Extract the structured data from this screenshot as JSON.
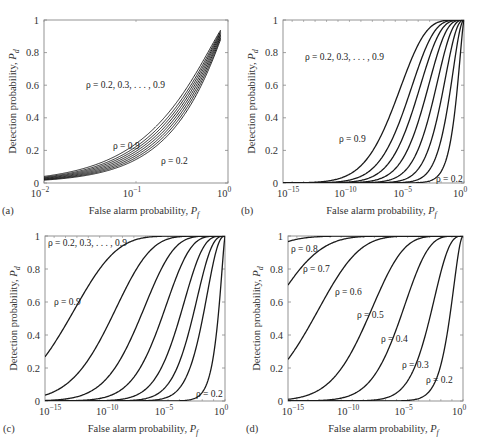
{
  "chart_data": [
    {
      "panel": "(a)",
      "type": "line",
      "xscale": "log",
      "xlim_exp": [
        -2,
        0
      ],
      "ylim": [
        0,
        1
      ],
      "xlabel": "False alarm probability, P_f",
      "ylabel": "Detection probability, P_d",
      "yticks": [
        "0",
        "0.2",
        "0.4",
        "0.6",
        "0.8",
        "1"
      ],
      "xticks": [
        {
          "base": "10",
          "exp": "−2",
          "v": -2
        },
        {
          "base": "10",
          "exp": "−1",
          "v": -1
        },
        {
          "base": "10",
          "exp": "0",
          "v": 0
        }
      ],
      "pf_max_exp": -0.08,
      "annotations": [
        {
          "text": "ρ = 0.2, 0.3, . . . , 0.9",
          "x": 86,
          "y": 88
        },
        {
          "text": "ρ = 0.9",
          "x": 113,
          "y": 149
        },
        {
          "text": "ρ = 0.2",
          "x": 161,
          "y": 164
        }
      ],
      "series": [
        {
          "name": "ρ = 0.2",
          "d": 0.22
        },
        {
          "name": "ρ = 0.3",
          "d": 0.27
        },
        {
          "name": "ρ = 0.4",
          "d": 0.32
        },
        {
          "name": "ρ = 0.5",
          "d": 0.37
        },
        {
          "name": "ρ = 0.6",
          "d": 0.42
        },
        {
          "name": "ρ = 0.7",
          "d": 0.47
        },
        {
          "name": "ρ = 0.8",
          "d": 0.52
        },
        {
          "name": "ρ = 0.9",
          "d": 0.58
        }
      ]
    },
    {
      "panel": "(b)",
      "type": "line",
      "xscale": "log",
      "xlim_exp": [
        -15.8,
        0
      ],
      "ylim": [
        0,
        1
      ],
      "xlabel": "False alarm probability, P_f",
      "ylabel": "Detection probability, P_d",
      "yticks": [
        "0",
        "0.2",
        "0.4",
        "0.6",
        "0.8",
        "1"
      ],
      "xticks": [
        {
          "base": "10",
          "exp": "−15",
          "v": -15
        },
        {
          "base": "10",
          "exp": "−10",
          "v": -10
        },
        {
          "base": "10",
          "exp": "−5",
          "v": -5
        },
        {
          "base": "10",
          "exp": "0",
          "v": 0
        }
      ],
      "annotations": [
        {
          "text": "ρ = 0.2, 0.3, . . . , 0.9",
          "x": 305,
          "y": 60
        },
        {
          "text": "ρ = 0.9",
          "x": 339,
          "y": 142
        },
        {
          "text": "ρ = 0.2",
          "x": 436,
          "y": 182
        }
      ],
      "series": [
        {
          "name": "ρ = 0.2",
          "d": 0.85
        },
        {
          "name": "ρ = 0.3",
          "d": 1.7
        },
        {
          "name": "ρ = 0.4",
          "d": 2.35
        },
        {
          "name": "ρ = 0.5",
          "d": 2.9
        },
        {
          "name": "ρ = 0.6",
          "d": 3.4
        },
        {
          "name": "ρ = 0.7",
          "d": 3.85
        },
        {
          "name": "ρ = 0.8",
          "d": 4.26
        },
        {
          "name": "ρ = 0.9",
          "d": 4.75
        }
      ]
    },
    {
      "panel": "(c)",
      "type": "line",
      "xscale": "log",
      "xlim_exp": [
        -15.8,
        0
      ],
      "ylim": [
        0,
        1
      ],
      "xlabel": "False alarm probability, P_f",
      "ylabel": "Detection probability, P_d",
      "yticks": [
        "0",
        "0.2",
        "0.4",
        "0.6",
        "0.8",
        "1"
      ],
      "xticks": [
        {
          "base": "10",
          "exp": "−15",
          "v": -15
        },
        {
          "base": "10",
          "exp": "−10",
          "v": -10
        },
        {
          "base": "10",
          "exp": "−5",
          "v": -5
        },
        {
          "base": "10",
          "exp": "0",
          "v": 0
        }
      ],
      "annotations": [
        {
          "text": "ρ = 0.2, 0.3, . . . , 0.9",
          "x": 48,
          "y": 246
        },
        {
          "text": "ρ = 0.9",
          "x": 54,
          "y": 305
        },
        {
          "text": "ρ = 0.2",
          "x": 196,
          "y": 397
        }
      ],
      "series": [
        {
          "name": "ρ = 0.2",
          "d": 0.7
        },
        {
          "name": "ρ = 0.3",
          "d": 2.3
        },
        {
          "name": "ρ = 0.4",
          "d": 3.0
        },
        {
          "name": "ρ = 0.5",
          "d": 3.72
        },
        {
          "name": "ρ = 0.6",
          "d": 4.55
        },
        {
          "name": "ρ = 0.7",
          "d": 5.4
        },
        {
          "name": "ρ = 0.8",
          "d": 6.36
        },
        {
          "name": "ρ = 0.9",
          "d": 7.55
        }
      ]
    },
    {
      "panel": "(d)",
      "type": "line",
      "xscale": "log",
      "xlim_exp": [
        -15.8,
        0
      ],
      "ylim": [
        0,
        1
      ],
      "xlabel": "False alarm probability, P_f",
      "ylabel": "Detection probability, P_d",
      "yticks": [
        "0",
        "0.2",
        "0.4",
        "0.6",
        "0.8",
        "1"
      ],
      "xticks": [
        {
          "base": "10",
          "exp": "−15",
          "v": -15
        },
        {
          "base": "10",
          "exp": "−10",
          "v": -10
        },
        {
          "base": "10",
          "exp": "−5",
          "v": -5
        },
        {
          "base": "10",
          "exp": "0",
          "v": 0
        }
      ],
      "annotations": [
        {
          "text": "ρ = 0.8",
          "x": 291,
          "y": 252
        },
        {
          "text": "ρ = 0.7",
          "x": 303,
          "y": 272
        },
        {
          "text": "ρ = 0.6",
          "x": 335,
          "y": 295
        },
        {
          "text": "ρ = 0.5",
          "x": 357,
          "y": 318
        },
        {
          "text": "ρ = 0.4",
          "x": 381,
          "y": 342
        },
        {
          "text": "ρ = 0.3",
          "x": 402,
          "y": 368
        },
        {
          "text": "ρ = 0.2",
          "x": 426,
          "y": 383
        }
      ],
      "series": [
        {
          "name": "ρ = 0.2",
          "d": 1.55
        },
        {
          "name": "ρ = 0.3",
          "d": 3.1
        },
        {
          "name": "ρ = 0.4",
          "d": 4.6
        },
        {
          "name": "ρ = 0.5",
          "d": 5.85
        },
        {
          "name": "ρ = 0.6",
          "d": 7.5
        },
        {
          "name": "ρ = 0.7",
          "d": 8.7
        },
        {
          "name": "ρ = 0.8",
          "d": 10.0
        }
      ]
    }
  ],
  "layout": {
    "panels": [
      {
        "left": 44,
        "top": 20,
        "right": 228,
        "bottom": 183
      },
      {
        "left": 283,
        "top": 20,
        "right": 464,
        "bottom": 183
      },
      {
        "left": 45,
        "top": 236,
        "right": 225,
        "bottom": 401
      },
      {
        "left": 288,
        "top": 236,
        "right": 463,
        "bottom": 401
      }
    ]
  }
}
